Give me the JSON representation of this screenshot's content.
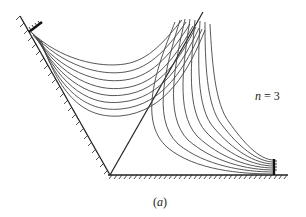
{
  "figure": {
    "parameter_label": {
      "var": "n",
      "eq": " = ",
      "value": "3"
    },
    "caption": {
      "open": "(",
      "letter": "a",
      "close": ")"
    },
    "colors": {
      "stroke": "#333333",
      "wall": "#222222",
      "background": "#ffffff"
    },
    "elements": {
      "left_wall": "inclined wall with hatching",
      "bottom_wall": "horizontal wall with hatching",
      "diagonal": "straight line from vertex",
      "left_curve_family_count": 8,
      "right_curve_family_count": 8
    }
  }
}
